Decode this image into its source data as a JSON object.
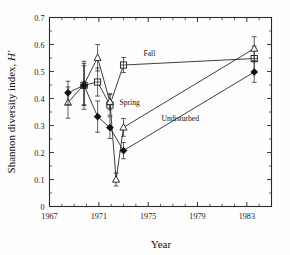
{
  "figure": {
    "background": "#fdfdfd",
    "ink_color": "#1c1c1c"
  },
  "chart_data": {
    "type": "line",
    "title": "",
    "subtitle": "",
    "xlabel": "Year",
    "ylabel": "Shannon diversity index, H′",
    "ylabel_plain": "Shannon diversity index,",
    "ylabel_symbol": "H′",
    "xlim": [
      1967,
      1985
    ],
    "ylim": [
      0,
      0.7
    ],
    "xticks": [
      1967,
      1968,
      1969,
      1970,
      1971,
      1972,
      1973,
      1974,
      1975,
      1976,
      1977,
      1978,
      1979,
      1980,
      1981,
      1982,
      1983,
      1984,
      1985
    ],
    "xtick_labels": [
      "1967",
      "",
      "",
      "",
      "1971",
      "",
      "",
      "",
      "1975",
      "",
      "",
      "",
      "1979",
      "",
      "",
      "",
      "1983",
      "",
      ""
    ],
    "xtick_labels_major": [
      "1967",
      "1971",
      "1975",
      "1979",
      "1983"
    ],
    "xticks_major": [
      1967,
      1971,
      1975,
      1979,
      1983
    ],
    "yticks": [
      0,
      0.1,
      0.2,
      0.3,
      0.4,
      0.5,
      0.6,
      0.7
    ],
    "ytick_labels": [
      "0",
      "0.1",
      "0.2",
      "0.3",
      "0.4",
      "0.5",
      "0.6",
      "0.7"
    ],
    "grid": false,
    "legend": "inline-annotations",
    "legend_position": "inline",
    "error_bars": "vertical, symmetric (standard deviation)",
    "annotations": [
      {
        "text": "Fall",
        "x": 1975.1,
        "y": 0.558
      },
      {
        "text": "Spring",
        "x": 1973.5,
        "y": 0.375
      },
      {
        "text": "Undisturbed",
        "x": 1977.6,
        "y": 0.318
      }
    ],
    "series": [
      {
        "name": "Fall",
        "marker": "open-square",
        "points": [
          {
            "x": 1969.8,
            "y": 0.449,
            "err": 0.072
          },
          {
            "x": 1970.9,
            "y": 0.461,
            "err": 0.052
          },
          {
            "x": 1971.9,
            "y": 0.376,
            "err": 0.038
          },
          {
            "x": 1973.0,
            "y": 0.524,
            "err": 0.028
          },
          {
            "x": 1983.6,
            "y": 0.548,
            "err": 0.046
          }
        ]
      },
      {
        "name": "Spring",
        "marker": "open-triangle",
        "points": [
          {
            "x": 1968.5,
            "y": 0.385,
            "err": 0.058
          },
          {
            "x": 1969.8,
            "y": 0.452,
            "err": 0.078
          },
          {
            "x": 1970.9,
            "y": 0.551,
            "err": 0.049
          },
          {
            "x": 1971.9,
            "y": 0.388,
            "err": 0.03
          },
          {
            "x": 1972.4,
            "y": 0.1,
            "err": 0.024
          },
          {
            "x": 1973.0,
            "y": 0.293,
            "err": 0.033
          },
          {
            "x": 1983.6,
            "y": 0.585,
            "err": 0.044
          }
        ]
      },
      {
        "name": "Undisturbed",
        "marker": "filled-diamond",
        "points": [
          {
            "x": 1968.5,
            "y": 0.421,
            "err": 0.043
          },
          {
            "x": 1969.8,
            "y": 0.449,
            "err": 0.089
          },
          {
            "x": 1970.9,
            "y": 0.333,
            "err": 0.058
          },
          {
            "x": 1971.9,
            "y": 0.292,
            "err": 0.04
          },
          {
            "x": 1973.0,
            "y": 0.207,
            "err": 0.03
          },
          {
            "x": 1983.6,
            "y": 0.498,
            "err": 0.038
          }
        ]
      }
    ]
  }
}
